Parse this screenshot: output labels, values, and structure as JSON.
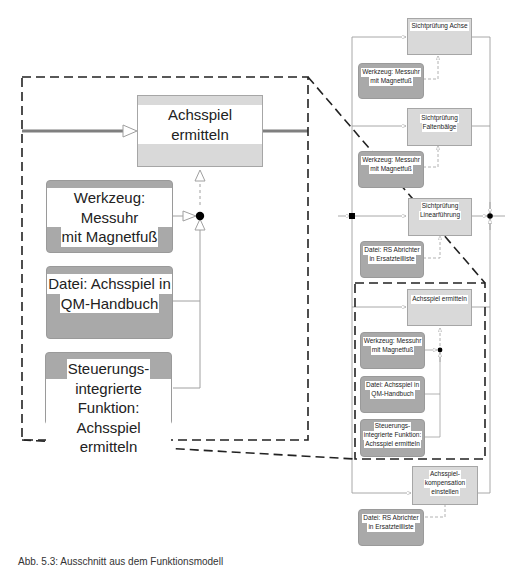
{
  "diagram": {
    "overview": {
      "functions": [
        {
          "id": "f1",
          "label": "Sichtprüfung Achse"
        },
        {
          "id": "f2",
          "label": "Sichtprüfung Faltenbälge"
        },
        {
          "id": "f3",
          "label": "Sichtprüfung Linearführung"
        },
        {
          "id": "f4",
          "label": "Achsspiel ermitteln"
        },
        {
          "id": "f5",
          "label": "Achsspiel-kompensation einstellen"
        }
      ],
      "resources": [
        {
          "id": "r1",
          "label": "Werkzeug: Messuhr mit Magnetfuß"
        },
        {
          "id": "r2",
          "label": "Werkzeug: Messuhr mit Magnetfuß"
        },
        {
          "id": "r3",
          "label": "Datei: RS Abrichter in Ersatzteilliste"
        },
        {
          "id": "r4",
          "label": "Werkzeug: Messuhr mit Magnetfuß"
        },
        {
          "id": "r5",
          "label": "Datei:  Achsspiel in QM-Handbuch"
        },
        {
          "id": "r6",
          "label": "Steuerungs-integrierte Funktion: Achsspiel ermitteln"
        },
        {
          "id": "r7",
          "label": "Datei: RS Abrichter in Ersatzteilliste"
        }
      ]
    },
    "detail": {
      "function": "Achsspiel ermitteln",
      "resources": [
        "Werkzeug: Messuhr mit Magnetfuß",
        "Datei:  Achsspiel in QM-Handbuch",
        "Steuerungs-integrierte Funktion: Achsspiel ermitteln"
      ]
    },
    "labels": {
      "f1": [
        "Sichtprüfung Achse"
      ],
      "f2": [
        "Sichtprüfung",
        "Faltenbälge"
      ],
      "f3": [
        "Sichtprüfung",
        "Linearführung"
      ],
      "f4": [
        "Achsspiel ermitteln"
      ],
      "f5": [
        "Achsspiel-",
        "kompensation",
        "einstellen"
      ],
      "r1": [
        "Werkzeug: Messuhr",
        "mit Magnetfuß"
      ],
      "r2": [
        "Werkzeug: Messuhr",
        "mit Magnetfuß"
      ],
      "r3": [
        "Datei: RS Abrichter",
        "in Ersatzteilliste"
      ],
      "r4": [
        "Werkzeug: Messuhr",
        "mit Magnetfuß"
      ],
      "r5": [
        "Datei:  Achsspiel in",
        "QM-Handbuch"
      ],
      "r6": [
        "Steuerungs-",
        "integrierte Funktion:",
        "Achsspiel ermitteln"
      ],
      "r7": [
        "Datei: RS Abrichter",
        "in Ersatzteilliste"
      ],
      "d_f": [
        "Achsspiel ermitteln"
      ],
      "d_r1": [
        "Werkzeug: Messuhr",
        "mit Magnetfuß"
      ],
      "d_r2": [
        "Datei:  Achsspiel in",
        "QM-Handbuch"
      ],
      "d_r3": [
        "Steuerungs-",
        "integrierte Funktion:",
        "Achsspiel ermitteln"
      ]
    },
    "caption": "Abb. 5.3: Ausschnitt aus dem Funktionsmodell"
  },
  "colors": {
    "function_fill": "#d9d9d9",
    "resource_fill": "#a9a9a9",
    "flow_line": "#9e9e9e",
    "thick_flow": "#808080",
    "dashed_frame": "#222222",
    "junction": "#000000"
  }
}
